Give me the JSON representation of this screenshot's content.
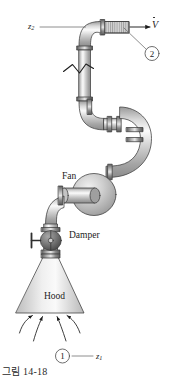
{
  "figure": {
    "type": "engineering-schematic",
    "caption": "그림 14-18"
  },
  "labels": {
    "fan": "Fan",
    "damper": "Damper",
    "hood": "Hood",
    "flow_rate_symbol": "V",
    "elevation_top": "z",
    "elevation_top_sub": "2",
    "elevation_bottom": "z",
    "elevation_bottom_sub": "1",
    "station_outlet": "2",
    "station_inlet": "1"
  },
  "colors": {
    "outline": "#3a3a3a",
    "pipe_light": "#f2f2f2",
    "pipe_mid": "#c9c9c9",
    "pipe_dark": "#8e8e8e",
    "flange": "#5a5a5a",
    "damper_body": "#6e6e6e",
    "hood_fill": "#d8d8d8",
    "background": "#ffffff",
    "text": "#1c1c1c"
  },
  "components": [
    {
      "name": "outlet-duct",
      "station": "2"
    },
    {
      "name": "top-elbow",
      "station": ""
    },
    {
      "name": "vertical-riser",
      "station": ""
    },
    {
      "name": "break-symbol",
      "station": ""
    },
    {
      "name": "s-bend",
      "station": ""
    },
    {
      "name": "u-bend",
      "station": ""
    },
    {
      "name": "fan",
      "station": ""
    },
    {
      "name": "damper",
      "station": ""
    },
    {
      "name": "hood",
      "station": "1"
    }
  ],
  "intake_arrows": 4
}
